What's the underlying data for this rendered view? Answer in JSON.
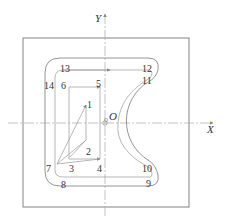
{
  "diagram": {
    "title": "",
    "axes": {
      "x_label": "X",
      "y_label": "Y",
      "origin_label": "O"
    },
    "points": [
      {
        "id": "1",
        "label": "1",
        "x": 86,
        "y": 103
      },
      {
        "id": "2",
        "label": "2",
        "x": 86,
        "y": 140
      },
      {
        "id": "3",
        "label": "3",
        "x": 70,
        "y": 159
      },
      {
        "id": "4",
        "label": "4",
        "x": 100,
        "y": 159
      },
      {
        "id": "5",
        "label": "5",
        "x": 100,
        "y": 86
      },
      {
        "id": "6",
        "label": "6",
        "x": 70,
        "y": 86
      },
      {
        "id": "7",
        "label": "7",
        "x": 57,
        "y": 164
      },
      {
        "id": "8",
        "label": "8",
        "x": 63,
        "y": 175
      },
      {
        "id": "9",
        "label": "9",
        "x": 150,
        "y": 175
      },
      {
        "id": "10",
        "label": "10",
        "x": 150,
        "y": 168
      },
      {
        "id": "11",
        "label": "11",
        "x": 150,
        "y": 80
      },
      {
        "id": "12",
        "label": "12",
        "x": 150,
        "y": 70
      },
      {
        "id": "13",
        "label": "13",
        "x": 63,
        "y": 70
      },
      {
        "id": "14",
        "label": "14",
        "x": 54,
        "y": 85
      }
    ],
    "colors": {
      "stroke": "#888888",
      "text": "#333333",
      "background": "#ffffff"
    }
  }
}
